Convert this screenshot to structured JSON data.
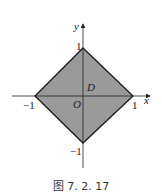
{
  "figure": {
    "caption": "图 7. 2. 17",
    "region_label": "D",
    "origin_label": "O",
    "x_axis_label": "x",
    "y_axis_label": "y",
    "ticks": {
      "x_pos": "1",
      "x_neg": "−1",
      "y_pos": "1",
      "y_neg": "−1"
    },
    "fill_color": "#9a9a9a",
    "stroke_color": "#1a1a1a"
  }
}
